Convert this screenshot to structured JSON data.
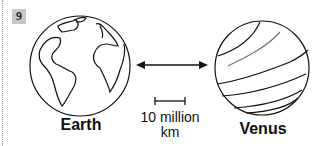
{
  "figure": {
    "number": "9",
    "planets": [
      {
        "name": "Earth"
      },
      {
        "name": "Venus"
      }
    ],
    "scale": {
      "value": "10 million",
      "unit": "km"
    },
    "arrow": "double-headed"
  }
}
